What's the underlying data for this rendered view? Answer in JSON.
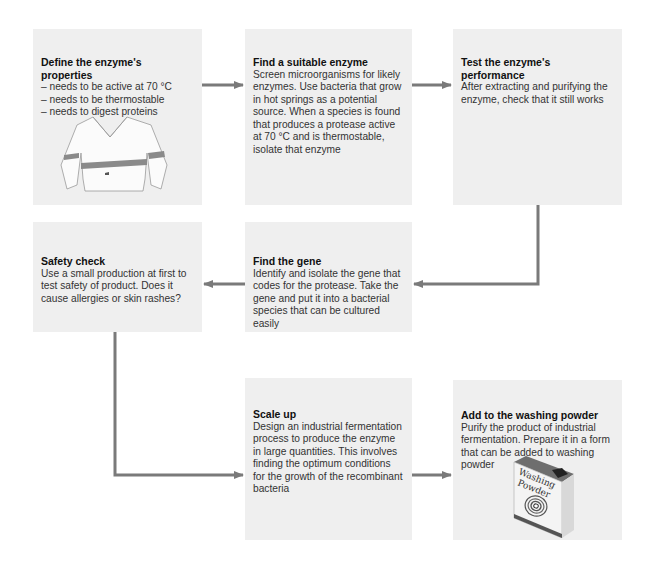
{
  "diagram": {
    "type": "flowchart",
    "arrow_color": "#7a7a7a",
    "box_color": "#efefef",
    "steps": [
      {
        "id": "define",
        "title": "Define the enzyme's properties",
        "bullets": [
          "needs to be active at 70 °C",
          "needs to be thermostable",
          "needs to digest proteins"
        ],
        "illustration": "sweater-with-stains"
      },
      {
        "id": "find-enzyme",
        "title": "Find a suitable enzyme",
        "text": "Screen microorganisms for likely enzymes. Use bacteria that grow in hot springs as a potential source. When a species is found that produces a protease active at 70 °C and is thermostable, isolate that enzyme"
      },
      {
        "id": "test",
        "title": "Test the enzyme's performance",
        "text": "After extracting and purifying the enzyme, check that it still works"
      },
      {
        "id": "find-gene",
        "title": "Find the gene",
        "text": "Identify and isolate the gene that codes for the protease. Take the gene and put it into a bacterial species that can be cultured easily"
      },
      {
        "id": "safety",
        "title": "Safety check",
        "text": "Use a small production at first to test safety of product. Does it cause allergies or skin rashes?"
      },
      {
        "id": "scale-up",
        "title": "Scale up",
        "text": "Design an industrial fermentation process to produce the enzyme in large quantities. This involves finding the optimum conditions for the growth of the recombinant bacteria"
      },
      {
        "id": "add-powder",
        "title": "Add to the washing powder",
        "text": "Purify the product of industrial fermentation. Prepare it in a form that can be added to washing powder",
        "illustration": "washing-powder-box",
        "illustration_label_line1": "Washing",
        "illustration_label_line2": "Powder"
      }
    ],
    "connections": [
      [
        "define",
        "find-enzyme"
      ],
      [
        "find-enzyme",
        "test"
      ],
      [
        "test",
        "find-gene"
      ],
      [
        "find-gene",
        "safety"
      ],
      [
        "safety",
        "scale-up"
      ],
      [
        "scale-up",
        "add-powder"
      ]
    ]
  }
}
